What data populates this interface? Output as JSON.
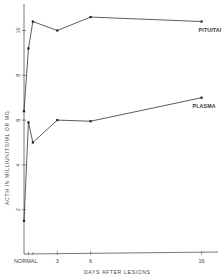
{
  "chart_data": {
    "type": "line",
    "title": "",
    "xlabel": "DAYS AFTER LESIONS",
    "ylabel": "ACTH IN MILLIUNITS/ML OR MG",
    "x_tick_labels": [
      "NORMAL",
      "3",
      "6",
      "16"
    ],
    "x_tick_values": [
      0,
      3,
      6,
      16
    ],
    "y_tick_labels": [
      "2",
      "4",
      "6",
      "8",
      "10"
    ],
    "y_tick_values": [
      2,
      4,
      6,
      8,
      10
    ],
    "ylim": [
      0,
      11
    ],
    "xlim": [
      0,
      16.5
    ],
    "grid": false,
    "legend": "inline labels at line ends",
    "series": [
      {
        "name": "PITUITARY",
        "x": [
          0,
          0.4,
          0.8,
          3,
          6,
          16
        ],
        "y": [
          6.4,
          9.2,
          10.4,
          10.0,
          10.6,
          10.4
        ]
      },
      {
        "name": "PLASMA",
        "x": [
          0,
          0.4,
          0.8,
          3,
          6,
          16
        ],
        "y": [
          1.5,
          5.9,
          5.0,
          6.0,
          5.95,
          7.0
        ]
      }
    ]
  }
}
